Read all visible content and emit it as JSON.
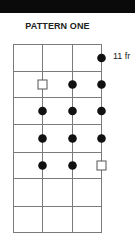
{
  "header": {
    "bar_color": "#0a0a0a"
  },
  "diagram": {
    "title": "PATTERN ONE",
    "fret_label": "11 fr",
    "line_color": "#7a7a7a",
    "dot_color": "#111111",
    "strings": 4,
    "frets": 7,
    "grid": {
      "x": [
        13,
        42,
        72,
        101
      ],
      "y": [
        44,
        71,
        97,
        124,
        152,
        178,
        206,
        232
      ]
    },
    "markers": [
      {
        "fret": 1,
        "string": 4,
        "type": "dot"
      },
      {
        "fret": 2,
        "string": 2,
        "type": "open-square"
      },
      {
        "fret": 2,
        "string": 3,
        "type": "dot"
      },
      {
        "fret": 2,
        "string": 4,
        "type": "dot"
      },
      {
        "fret": 3,
        "string": 2,
        "type": "dot"
      },
      {
        "fret": 3,
        "string": 3,
        "type": "dot"
      },
      {
        "fret": 3,
        "string": 4,
        "type": "dot"
      },
      {
        "fret": 4,
        "string": 2,
        "type": "dot"
      },
      {
        "fret": 4,
        "string": 3,
        "type": "dot"
      },
      {
        "fret": 4,
        "string": 4,
        "type": "dot"
      },
      {
        "fret": 5,
        "string": 2,
        "type": "dot"
      },
      {
        "fret": 5,
        "string": 3,
        "type": "dot"
      },
      {
        "fret": 5,
        "string": 4,
        "type": "open-square"
      }
    ]
  }
}
